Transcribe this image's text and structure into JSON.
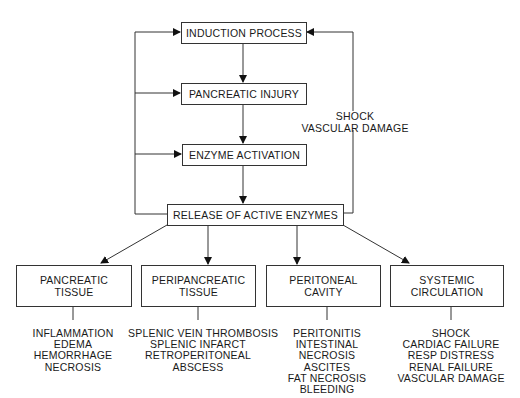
{
  "flow": {
    "induction": "INDUCTION PROCESS",
    "injury": "PANCREATIC INJURY",
    "activation": "ENZYME ACTIVATION",
    "release": "RELEASE OF ACTIVE ENZYMES"
  },
  "feedback_label": {
    "line1": "SHOCK",
    "line2": "VASCULAR DAMAGE"
  },
  "targets": [
    {
      "title1": "PANCREATIC",
      "title2": "TISSUE",
      "effects": [
        "INFLAMMATION",
        "EDEMA",
        "HEMORRHAGE",
        "NECROSIS"
      ]
    },
    {
      "title1": "PERIPANCREATIC",
      "title2": "TISSUE",
      "effects": [
        "SPLENIC VEIN THROMBOSIS",
        "SPLENIC INFARCT",
        "RETROPERITONEAL",
        "ABSCESS"
      ]
    },
    {
      "title1": "PERITONEAL",
      "title2": "CAVITY",
      "effects": [
        "PERITONITIS",
        "INTESTINAL",
        "NECROSIS",
        "ASCITES",
        "FAT NECROSIS",
        "BLEEDING"
      ]
    },
    {
      "title1": "SYSTEMIC",
      "title2": "CIRCULATION",
      "effects": [
        "SHOCK",
        "CARDIAC FAILURE",
        "RESP DISTRESS",
        "RENAL FAILURE",
        "VASCULAR DAMAGE"
      ]
    }
  ]
}
